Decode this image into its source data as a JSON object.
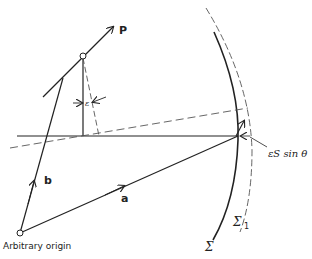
{
  "labels": {
    "p": "P",
    "a": "a",
    "b": "b",
    "origin": "Arbitrary origin",
    "sigma": "Σ",
    "sigma1": "Σ",
    "sigma1_sub": "1",
    "epsilon": "ε",
    "epsilon_s_sin_theta": "εS sin θ"
  },
  "colors": {
    "ink": "#222222",
    "dashed": "#555555",
    "background": "#ffffff"
  }
}
